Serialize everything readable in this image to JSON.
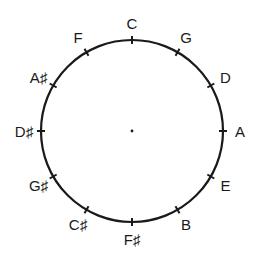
{
  "diagram": {
    "center": {
      "x": 132,
      "y": 131
    },
    "radius": 91,
    "label_radius": 108,
    "tick_length": 8,
    "stroke_color": "#1a1a1a",
    "text_color": "#1a1a1a",
    "background": "#ffffff",
    "notes": [
      {
        "label": "C",
        "angle_deg": 0
      },
      {
        "label": "G",
        "angle_deg": 30
      },
      {
        "label": "D",
        "angle_deg": 60
      },
      {
        "label": "A",
        "angle_deg": 90
      },
      {
        "label": "E",
        "angle_deg": 120
      },
      {
        "label": "B",
        "angle_deg": 150
      },
      {
        "label": "F♯",
        "angle_deg": 180
      },
      {
        "label": "C♯",
        "angle_deg": 210
      },
      {
        "label": "G♯",
        "angle_deg": 240
      },
      {
        "label": "D♯",
        "angle_deg": 270
      },
      {
        "label": "A♯",
        "angle_deg": 300
      },
      {
        "label": "F",
        "angle_deg": 330
      }
    ]
  }
}
